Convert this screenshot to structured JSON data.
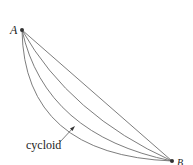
{
  "diagram": {
    "points": {
      "A": {
        "label": "A",
        "x": 22,
        "y": 30
      },
      "B": {
        "label": "B",
        "x": 172,
        "y": 161
      }
    },
    "curves": [
      {
        "name": "straight-line",
        "path": "M22,30 L172,161"
      },
      {
        "name": "curve-1",
        "path": "M22,30 Q70,115 172,161"
      },
      {
        "name": "curve-2",
        "path": "M22,30 Q45,135 172,161"
      },
      {
        "name": "cycloid",
        "path": "M22,30 Q24,155 172,161"
      }
    ],
    "annotation": {
      "label": "cycloid",
      "arrow_from": [
        60,
        142
      ],
      "arrow_to": [
        74,
        127
      ]
    },
    "colors": {
      "curve": "#6e6e6e",
      "point": "#333333",
      "text": "#222222"
    }
  }
}
